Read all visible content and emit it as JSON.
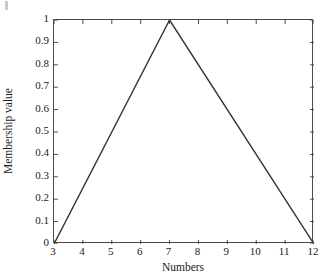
{
  "chart_data": {
    "type": "line",
    "title": "",
    "subtitle": "",
    "xlabel": "Numbers",
    "ylabel": "Membership value",
    "xlim": [
      3,
      12
    ],
    "ylim": [
      0,
      1
    ],
    "xticks": [
      3,
      4,
      5,
      6,
      7,
      8,
      9,
      10,
      11,
      12
    ],
    "xtick_labels": [
      "3",
      "4",
      "5",
      "6",
      "7",
      "8",
      "9",
      "10",
      "11",
      "12"
    ],
    "yticks": [
      0,
      0.1,
      0.2,
      0.3,
      0.4,
      0.5,
      0.6,
      0.7,
      0.8,
      0.9,
      1
    ],
    "ytick_labels": [
      "0",
      "0.1",
      "0.2",
      "0.3",
      "0.4",
      "0.5",
      "0.6",
      "0.7",
      "0.8",
      "0.9",
      "1"
    ],
    "grid": false,
    "legend": null,
    "legend_position": "none",
    "tick_direction": "in",
    "box": true,
    "series": [
      {
        "name": "triangular membership function",
        "x": [
          3,
          7,
          12
        ],
        "values": [
          0,
          1,
          0
        ],
        "color": "#333333",
        "line_width": 1.4,
        "marker": "none"
      }
    ],
    "annotations": []
  },
  "figure": {
    "background_color": "#ffffff",
    "axis_color": "#4a4a4a",
    "text_color": "#1a1a1a",
    "artifact_color": "#b8b8b8"
  }
}
